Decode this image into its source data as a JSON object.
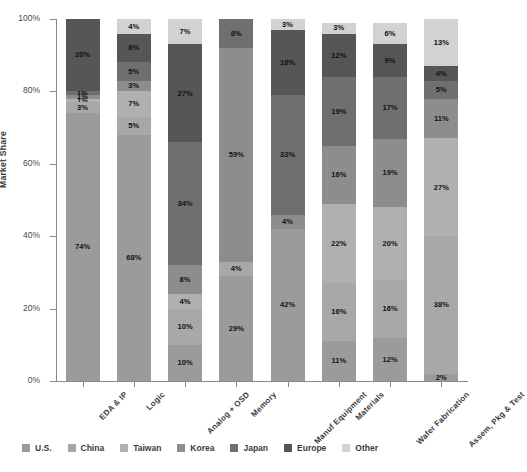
{
  "chart_data": {
    "type": "bar",
    "stacked": true,
    "title": "",
    "xlabel": "",
    "ylabel": "Market Share",
    "ylim": [
      0,
      100
    ],
    "ytick_labels": [
      "0%",
      "20%",
      "40%",
      "60%",
      "80%",
      "100%"
    ],
    "ytick_values": [
      0,
      20,
      40,
      60,
      80,
      100
    ],
    "grid": false,
    "legend_position": "bottom",
    "categories": [
      "EDA & IP",
      "Logic",
      "Analog + OSD",
      "Memory",
      "Manuf Equipment",
      "Materials",
      "Wafer Fabrication",
      "Assem, Pkg & Test"
    ],
    "series": [
      {
        "name": "U.S.",
        "color": "#9b9b9b",
        "values": [
          74,
          68,
          10,
          29,
          42,
          11,
          12,
          2
        ]
      },
      {
        "name": "China",
        "color": "#a8a8a8",
        "values": [
          3,
          5,
          10,
          4,
          0,
          16,
          16,
          38
        ]
      },
      {
        "name": "Taiwan",
        "color": "#b0b0b0",
        "values": [
          1,
          7,
          4,
          0,
          0,
          22,
          20,
          27
        ]
      },
      {
        "name": "Korea",
        "color": "#8d8d8d",
        "values": [
          1,
          3,
          8,
          59,
          4,
          16,
          19,
          11
        ]
      },
      {
        "name": "Japan",
        "color": "#6f6f6f",
        "values": [
          1,
          5,
          34,
          8,
          33,
          19,
          17,
          5
        ]
      },
      {
        "name": "Europe",
        "color": "#565656",
        "values": [
          20,
          8,
          27,
          0,
          18,
          12,
          9,
          4
        ]
      },
      {
        "name": "Other",
        "color": "#d2d2d2",
        "values": [
          0,
          4,
          7,
          0,
          3,
          3,
          6,
          13
        ]
      }
    ],
    "segment_labels": [
      [
        "74%",
        "3%",
        "1%",
        "1%",
        "1%",
        "20%",
        ""
      ],
      [
        "68%",
        "5%",
        "7%",
        "3%",
        "5%",
        "8%",
        "4%"
      ],
      [
        "10%",
        "10%",
        "4%",
        "8%",
        "34%",
        "27%",
        "7%"
      ],
      [
        "29%",
        "4%",
        "",
        "59%",
        "8%",
        "",
        ""
      ],
      [
        "42%",
        "",
        "",
        "4%",
        "33%",
        "18%",
        "3%"
      ],
      [
        "11%",
        "16%",
        "22%",
        "16%",
        "19%",
        "12%",
        "3%"
      ],
      [
        "12%",
        "16%",
        "20%",
        "19%",
        "17%",
        "9%",
        "6%"
      ],
      [
        "2%",
        "38%",
        "27%",
        "11%",
        "5%",
        "4%",
        "13%"
      ]
    ]
  },
  "legend": {
    "items": [
      {
        "label": "U.S.",
        "color": "#9b9b9b"
      },
      {
        "label": "China",
        "color": "#a8a8a8"
      },
      {
        "label": "Taiwan",
        "color": "#b0b0b0"
      },
      {
        "label": "Korea",
        "color": "#8d8d8d"
      },
      {
        "label": "Japan",
        "color": "#6f6f6f"
      },
      {
        "label": "Europe",
        "color": "#565656"
      },
      {
        "label": "Other",
        "color": "#d2d2d2"
      }
    ]
  }
}
